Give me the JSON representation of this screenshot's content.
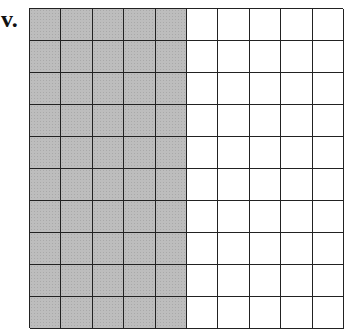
{
  "label": "v.",
  "grid": {
    "rows": 10,
    "columns": 10,
    "shaded_columns": 5,
    "shaded_cells": 50,
    "total_cells": 100,
    "shade_color": "#bdbdbd",
    "line_color": "#222222"
  }
}
